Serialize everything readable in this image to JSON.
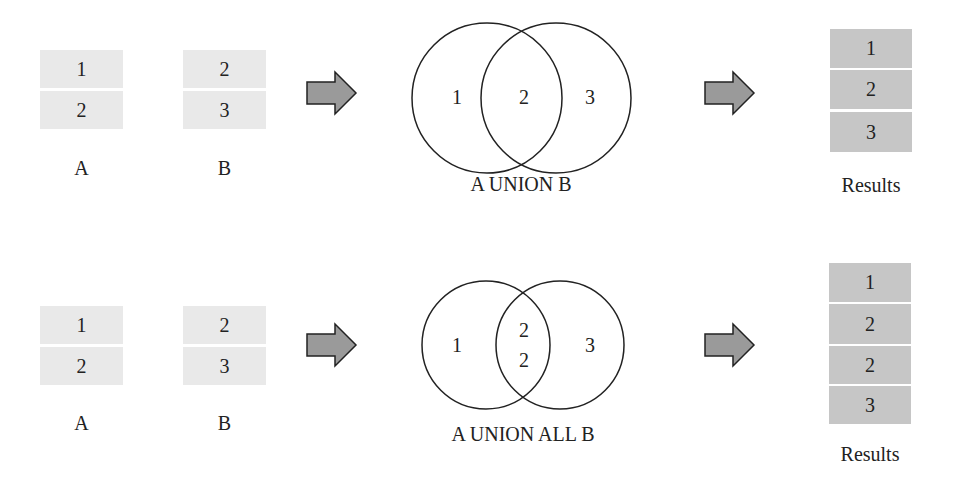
{
  "colors": {
    "input_cell": "#e9e9e9",
    "result_cell": "#c6c6c6",
    "arrow_fill": "#9a9a9a",
    "stroke": "#222222"
  },
  "rows": [
    {
      "table_a": {
        "label": "A",
        "values": [
          "1",
          "2"
        ]
      },
      "table_b": {
        "label": "B",
        "values": [
          "2",
          "3"
        ]
      },
      "venn": {
        "left": "1",
        "middle": [
          "2"
        ],
        "right": "3",
        "caption": "A UNION B"
      },
      "results": {
        "label": "Results",
        "values": [
          "1",
          "2",
          "3"
        ]
      }
    },
    {
      "table_a": {
        "label": "A",
        "values": [
          "1",
          "2"
        ]
      },
      "table_b": {
        "label": "B",
        "values": [
          "2",
          "3"
        ]
      },
      "venn": {
        "left": "1",
        "middle": [
          "2",
          "2"
        ],
        "right": "3",
        "caption": "A UNION ALL B"
      },
      "results": {
        "label": "Results",
        "values": [
          "1",
          "2",
          "2",
          "3"
        ]
      }
    }
  ]
}
